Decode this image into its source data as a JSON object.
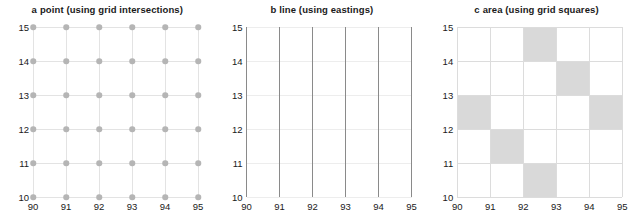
{
  "figure": {
    "background": "#ffffff",
    "dot_color": "#b5b5b5",
    "line_color": "#8a8a8a",
    "fill_color": "#d9d9d9",
    "grid_color": "#e3e3e3"
  },
  "chart_data": [
    {
      "type": "scatter",
      "panel_letter": "a",
      "title": "point (using grid intersections)",
      "full_title": "a  point (using grid intersections)",
      "xlabel": "",
      "ylabel": "",
      "xlim": [
        90,
        95
      ],
      "ylim": [
        10,
        15
      ],
      "xticks": [
        90,
        91,
        92,
        93,
        94,
        95
      ],
      "yticks": [
        10,
        11,
        12,
        13,
        14,
        15
      ],
      "grid": true,
      "legend": "none",
      "marker": "circle",
      "marker_color": "#b5b5b5",
      "points_x": [
        90,
        91,
        92,
        93,
        94,
        95,
        90,
        91,
        92,
        93,
        94,
        95,
        90,
        91,
        92,
        93,
        94,
        95,
        90,
        91,
        92,
        93,
        94,
        95,
        90,
        91,
        92,
        93,
        94,
        95,
        90,
        91,
        92,
        93,
        94,
        95
      ],
      "points_y": [
        15,
        15,
        15,
        15,
        15,
        15,
        14,
        14,
        14,
        14,
        14,
        14,
        13,
        13,
        13,
        13,
        13,
        13,
        12,
        12,
        12,
        12,
        12,
        12,
        11,
        11,
        11,
        11,
        11,
        11,
        10,
        10,
        10,
        10,
        10,
        10
      ]
    },
    {
      "type": "line",
      "panel_letter": "b",
      "title": "line (using eastings)",
      "full_title": "b  line (using eastings)",
      "xlabel": "",
      "ylabel": "",
      "xlim": [
        90,
        95
      ],
      "ylim": [
        10,
        15
      ],
      "xticks": [
        90,
        91,
        92,
        93,
        94,
        95
      ],
      "yticks": [
        10,
        11,
        12,
        13,
        14,
        15
      ],
      "grid": true,
      "legend": "none",
      "line_color": "#8a8a8a",
      "vertical_lines_at_x": [
        90,
        91,
        92,
        93,
        94,
        95
      ]
    },
    {
      "type": "heatmap",
      "panel_letter": "c",
      "title": "area (using grid squares)",
      "full_title": "c  area (using grid squares)",
      "xlabel": "",
      "ylabel": "",
      "xlim": [
        90,
        95
      ],
      "ylim": [
        10,
        15
      ],
      "xticks": [
        90,
        91,
        92,
        93,
        94,
        95
      ],
      "yticks": [
        10,
        11,
        12,
        13,
        14,
        15
      ],
      "grid": true,
      "legend": "none",
      "fill_color": "#d9d9d9",
      "shaded_squares": [
        {
          "easting": 92,
          "northing": 14
        },
        {
          "easting": 93,
          "northing": 13
        },
        {
          "easting": 90,
          "northing": 12
        },
        {
          "easting": 94,
          "northing": 12
        },
        {
          "easting": 91,
          "northing": 11
        },
        {
          "easting": 92,
          "northing": 10
        }
      ]
    }
  ]
}
